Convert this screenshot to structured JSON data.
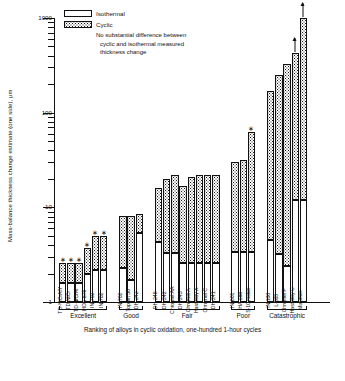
{
  "axes": {
    "ylabel": "Mass-balance thickness change estimate (one side), µm",
    "xlabel": "Ranking of alloys in cyclic oxidation, one-hundred 1-hour cycles",
    "yticks": [
      "1",
      "10",
      "100",
      "1000"
    ]
  },
  "legend": {
    "isothermal": "Isothermal",
    "cyclic": "Cyclic",
    "note_line1": "No substantial difference between",
    "note_line2": "cyclic and isothermal measured",
    "note_line3": "thickness change",
    "star_glyph": "∗"
  },
  "chart_data": {
    "type": "bar",
    "title": "",
    "xlabel": "Ranking of alloys in cyclic oxidation, one-hundred 1-hour cycles",
    "ylabel": "Mass-balance thickness change estimate (one side), µm",
    "yscale": "log",
    "ylim": [
      1,
      1000
    ],
    "yticks": [
      1,
      10,
      100,
      1000
    ],
    "grid": false,
    "legend_position": "top-left",
    "series": [
      {
        "name": "Isothermal",
        "fill": "white"
      },
      {
        "name": "Cyclic",
        "fill": "stippled"
      }
    ],
    "groups": [
      {
        "name": "Excellent",
        "bars": [
          {
            "label": "TD-NiCrAlY",
            "isothermal": 1.6,
            "cyclic": 2.6,
            "star": true,
            "arrow": false
          },
          {
            "label": "TD-NiCr",
            "isothermal": 1.6,
            "cyclic": 2.6,
            "star": true,
            "arrow": false
          },
          {
            "label": "TD-NiCrAl",
            "isothermal": 1.6,
            "cyclic": 2.6,
            "star": true,
            "arrow": false
          },
          {
            "label": "HOS-875",
            "isothermal": 2.0,
            "cyclic": 3.7,
            "star": true,
            "arrow": false
          },
          {
            "label": "IN-702",
            "isothermal": 2.2,
            "cyclic": 5.0,
            "star": true,
            "arrow": false
          },
          {
            "label": "IN-702",
            "isothermal": 2.2,
            "cyclic": 5.0,
            "star": true,
            "arrow": false
          }
        ]
      },
      {
        "name": "Good",
        "bars": [
          {
            "label": "IN-702",
            "isothermal": 2.3,
            "cyclic": 8.2,
            "star": false,
            "arrow": false
          },
          {
            "label": "Tophet 30",
            "isothermal": 1.7,
            "cyclic": 8.2,
            "star": false,
            "arrow": false
          },
          {
            "label": "DH-242",
            "isothermal": 5.3,
            "cyclic": 8.5,
            "star": false,
            "arrow": false
          }
        ]
      },
      {
        "name": "Fair",
        "bars": [
          {
            "label": "DH-245",
            "isothermal": 4.3,
            "cyclic": 16.0,
            "star": false,
            "arrow": false
          },
          {
            "label": "DH-242",
            "isothermal": 3.3,
            "cyclic": 20.0,
            "star": false,
            "arrow": false
          },
          {
            "label": "Chromel AA",
            "isothermal": 3.3,
            "cyclic": 22.0,
            "star": false,
            "arrow": false
          },
          {
            "label": "DH-243",
            "isothermal": 2.6,
            "cyclic": 17.0,
            "star": false,
            "arrow": false
          },
          {
            "label": "Chromel A",
            "isothermal": 2.6,
            "cyclic": 21.0,
            "star": false,
            "arrow": false
          },
          {
            "label": "Hastelloy X",
            "isothermal": 2.6,
            "cyclic": 22.0,
            "star": false,
            "arrow": false
          },
          {
            "label": "Chromel C",
            "isothermal": 2.6,
            "cyclic": 22.0,
            "star": false,
            "arrow": false
          },
          {
            "label": "DH-241",
            "isothermal": 2.6,
            "cyclic": 22.0,
            "star": false,
            "arrow": false
          }
        ]
      },
      {
        "name": "Poor",
        "bars": [
          {
            "label": "IN-601",
            "isothermal": 3.4,
            "cyclic": 30.0,
            "star": false,
            "arrow": false
          },
          {
            "label": "HA 188",
            "isothermal": 3.4,
            "cyclic": 32.0,
            "star": false,
            "arrow": false
          },
          {
            "label": "S-10 nickel",
            "isothermal": 3.4,
            "cyclic": 62.0,
            "star": true,
            "arrow": false
          }
        ]
      },
      {
        "name": "Catastrophic",
        "bars": [
          {
            "label": "IN 100",
            "isothermal": 4.5,
            "cyclic": 170.0,
            "star": false,
            "arrow": false
          },
          {
            "label": "L-605",
            "isothermal": 3.2,
            "cyclic": 250.0,
            "star": false,
            "arrow": false
          },
          {
            "label": "Chromel P",
            "isothermal": 2.4,
            "cyclic": 330.0,
            "star": false,
            "arrow": false
          },
          {
            "label": "Hastelloy-C",
            "isothermal": 12.0,
            "cyclic": 430.0,
            "star": false,
            "arrow": true
          },
          {
            "label": "Multimet",
            "isothermal": 12.0,
            "cyclic": 1000.0,
            "star": false,
            "arrow": true
          }
        ]
      }
    ]
  }
}
